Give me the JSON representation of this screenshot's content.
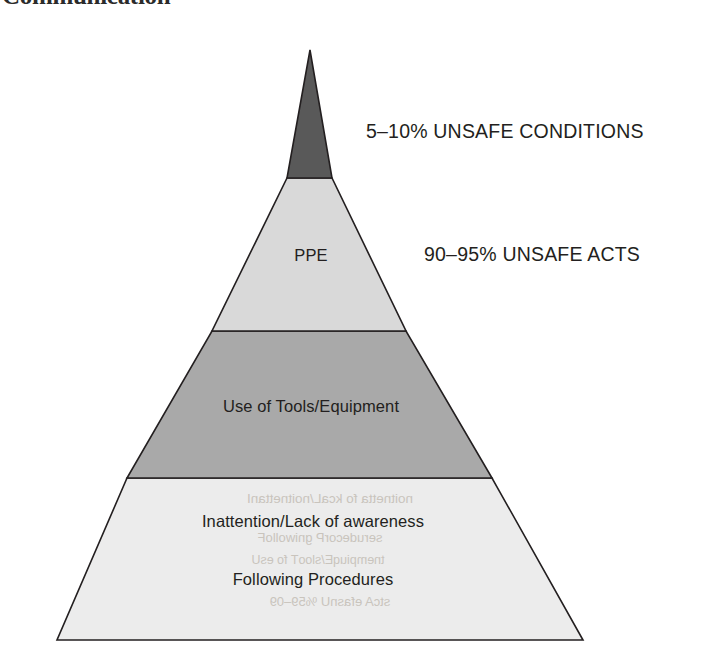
{
  "page": {
    "background_color": "#ffffff",
    "cut_off_heading": "Communication"
  },
  "diagram": {
    "type": "pyramid",
    "outline_color": "#231f20",
    "tiers": [
      {
        "index": 1,
        "position": "top",
        "label": "",
        "fill_color": "#595959"
      },
      {
        "index": 2,
        "position": "upper-middle",
        "label": "PPE",
        "fill_color": "#d9d9d9"
      },
      {
        "index": 3,
        "position": "lower-middle",
        "label": "Use of Tools/Equipment",
        "fill_color": "#a9a9a9"
      },
      {
        "index": 4,
        "position": "base",
        "label_line_1": "Inattention/Lack of awareness",
        "label_line_2": "Following Procedures",
        "fill_color": "#ececec"
      }
    ],
    "callouts": [
      {
        "id": "unsafe-conditions",
        "text": "5–10% UNSAFE CONDITIONS",
        "points_to_tier": 1
      },
      {
        "id": "unsafe-acts",
        "text": "90–95% UNSAFE ACTS",
        "points_to_tier": 2
      }
    ]
  },
  "ghost": {
    "line1": "noitnetta fo kcaL/noitnettanI",
    "line2": "serudecorP gniwolloF",
    "line3": "tnempiuqE/slooT fo esU",
    "line4": "stcA efasnU %59–09"
  }
}
